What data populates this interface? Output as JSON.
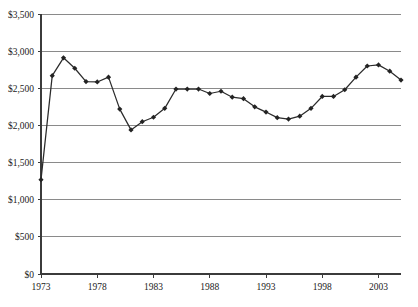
{
  "chart_data": {
    "type": "line",
    "title": "",
    "subtitle": "",
    "xlabel": "",
    "ylabel": "",
    "xlim": [
      1973,
      2005
    ],
    "ylim": [
      0,
      3500
    ],
    "grid": true,
    "legend": false,
    "marker": "diamond",
    "line_color": "#2b2b2b",
    "grid_color": "#8a8a8a",
    "axis_color": "#3b3b3b",
    "background_color": "#ffffff",
    "y_ticks": [
      0,
      500,
      1000,
      1500,
      2000,
      2500,
      3000,
      3500
    ],
    "y_tick_labels": [
      "$0",
      "$500",
      "$1,000",
      "$1,500",
      "$2,000",
      "$2,500",
      "$3,000",
      "$3,500"
    ],
    "x_ticks": [
      1973,
      1978,
      1983,
      1988,
      1993,
      1998,
      2003
    ],
    "x_tick_labels": [
      "1973",
      "1978",
      "1983",
      "1988",
      "1993",
      "1998",
      "2003"
    ],
    "x": [
      1973,
      1974,
      1975,
      1976,
      1977,
      1978,
      1979,
      1980,
      1981,
      1982,
      1983,
      1984,
      1985,
      1986,
      1987,
      1988,
      1989,
      1990,
      1991,
      1992,
      1993,
      1994,
      1995,
      1996,
      1997,
      1998,
      1999,
      2000,
      2001,
      2002,
      2003,
      2004,
      2005
    ],
    "values": [
      1270,
      2670,
      2910,
      2770,
      2590,
      2585,
      2650,
      2220,
      1940,
      2050,
      2110,
      2230,
      2490,
      2490,
      2490,
      2430,
      2460,
      2380,
      2360,
      2250,
      2180,
      2105,
      2085,
      2125,
      2230,
      2390,
      2390,
      2480,
      2650,
      2800,
      2815,
      2730,
      2610
    ],
    "series": [
      {
        "name": "value",
        "values": [
          1270,
          2670,
          2910,
          2770,
          2590,
          2585,
          2650,
          2220,
          1940,
          2050,
          2110,
          2230,
          2490,
          2490,
          2490,
          2430,
          2460,
          2380,
          2360,
          2250,
          2180,
          2105,
          2085,
          2125,
          2230,
          2390,
          2390,
          2480,
          2650,
          2800,
          2815,
          2730,
          2610
        ]
      }
    ],
    "annotations": []
  },
  "plot_geometry": {
    "left": 41,
    "right": 401,
    "top": 14,
    "bottom": 274
  }
}
